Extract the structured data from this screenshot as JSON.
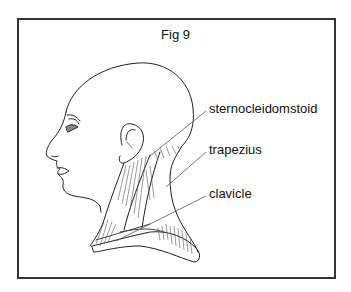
{
  "figure": {
    "title": "Fig 9",
    "labels": [
      {
        "text": "sternocleidomstoid",
        "top": 101
      },
      {
        "text": "trapezius",
        "top": 142
      },
      {
        "text": "clavicle",
        "top": 186
      }
    ],
    "colors": {
      "border": "#333333",
      "line": "#222222",
      "leader": "#555555",
      "background": "#ffffff"
    }
  }
}
